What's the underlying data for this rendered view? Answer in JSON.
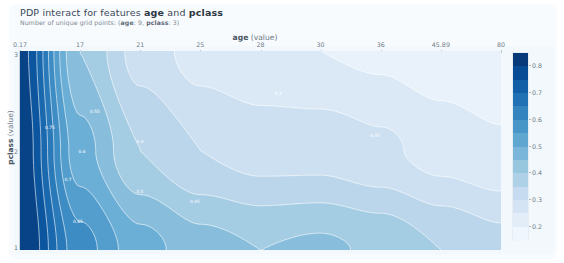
{
  "header": {
    "title_prefix": "PDP interact for features ",
    "title_feature_1": "age",
    "title_join": " and ",
    "title_feature_2": "pclass",
    "subtitle_prefix": "Number of unique grid points: (",
    "subtitle_feature_1": "age",
    "subtitle_value_1": ": 9, ",
    "subtitle_feature_2": "pclass",
    "subtitle_value_2": ": 3)"
  },
  "axes": {
    "x_title_main": "age",
    "x_title_unit": " (value)",
    "y_title_main": "pclass",
    "y_title_unit": " (value)"
  },
  "colorbar": {
    "ticks": [
      "0.2",
      "0.3",
      "0.4",
      "0.5",
      "0.6",
      "0.7",
      "0.8"
    ],
    "low_color": "#f7fbff",
    "high_color": "#08306b"
  },
  "chart_data": {
    "type": "heatmap",
    "title": "PDP interact for features age and pclass",
    "subtitle": "Number of unique grid points: (age: 9, pclass: 3)",
    "xlabel": "age (value)",
    "ylabel": "pclass (value)",
    "colormap": "Blues",
    "grid": false,
    "legend_position": "right",
    "x": [
      0.17,
      17,
      21,
      25,
      28,
      30,
      36,
      45.89,
      80
    ],
    "x_tick_labels": [
      "0.17",
      "17",
      "21",
      "25",
      "28",
      "30",
      "36",
      "45.89",
      "80"
    ],
    "y": [
      1,
      2,
      3
    ],
    "y_tick_labels": [
      "1",
      "2",
      "3"
    ],
    "zlim": [
      0.15,
      0.85
    ],
    "colorbar_ticks": [
      0.2,
      0.3,
      0.4,
      0.5,
      0.6,
      0.7,
      0.8
    ],
    "contour_levels": [
      0.2,
      0.25,
      0.3,
      0.35,
      0.4,
      0.45,
      0.5,
      0.55,
      0.6,
      0.65,
      0.7,
      0.75,
      0.8
    ],
    "contour_labels": [
      "0.75",
      "0.7",
      "0.65",
      "0.6",
      "0.55",
      "0.5",
      "0.45",
      "0.4",
      "0.35",
      "0.3"
    ],
    "z_rows": [
      {
        "pclass": 3,
        "values": [
          0.82,
          0.45,
          0.33,
          0.28,
          0.26,
          0.25,
          0.24,
          0.22,
          0.2
        ]
      },
      {
        "pclass": 2,
        "values": [
          0.84,
          0.52,
          0.4,
          0.35,
          0.33,
          0.33,
          0.31,
          0.28,
          0.26
        ]
      },
      {
        "pclass": 1,
        "values": [
          0.86,
          0.62,
          0.52,
          0.47,
          0.45,
          0.46,
          0.44,
          0.4,
          0.37
        ]
      }
    ],
    "note": "z is predicted survival probability; highest at low age across all pclass, decaying with age; pclass=1 retains higher values."
  }
}
